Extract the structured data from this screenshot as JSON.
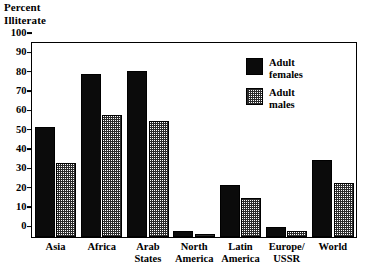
{
  "chart_data": {
    "type": "bar",
    "title": "Percent\nIlliterate",
    "xlabel": "",
    "ylabel": "Percent Illiterate",
    "ylim": [
      0,
      100
    ],
    "yticks": [
      0,
      10,
      20,
      30,
      40,
      50,
      60,
      70,
      80,
      90,
      100
    ],
    "grid": false,
    "legend_position": "inside-upper-right",
    "categories": [
      "Asia",
      "Africa",
      "Arab\nStates",
      "North\nAmerica",
      "Latin\nAmerica",
      "Europe/\nUSSR",
      "World"
    ],
    "series": [
      {
        "name": "Adult\nfemales",
        "color": "#0b0b0b",
        "pattern": "solid",
        "values": [
          57,
          84,
          86,
          3,
          27,
          5,
          40
        ]
      },
      {
        "name": "Adult\nmales",
        "color": "#2b2b2b",
        "pattern": "stipple",
        "values": [
          38,
          63,
          60,
          1.5,
          20,
          3,
          28
        ]
      }
    ]
  }
}
